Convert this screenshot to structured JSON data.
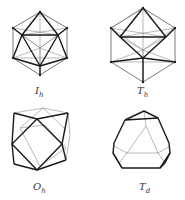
{
  "figure": {
    "panels": [
      {
        "id": "ih",
        "shape": "icosahedron",
        "label_main": "I",
        "label_sub": "h"
      },
      {
        "id": "th",
        "shape": "pyritohedral-icosahedron",
        "label_main": "T",
        "label_sub": "h"
      },
      {
        "id": "oh",
        "shape": "cuboctahedron",
        "label_main": "O",
        "label_sub": "h"
      },
      {
        "id": "td",
        "shape": "truncated-tetrahedron",
        "label_main": "T",
        "label_sub": "d"
      }
    ]
  }
}
